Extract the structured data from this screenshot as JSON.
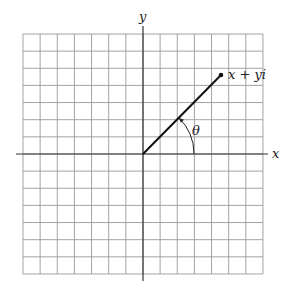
{
  "diagram": {
    "grid": {
      "columns": 14,
      "rows": 14,
      "left": 23,
      "top": 34,
      "cell_size": 17.14,
      "line_color": "#9a9a9a"
    },
    "axes": {
      "color": "#333333",
      "origin": {
        "x": 143,
        "y": 154
      },
      "x_axis": {
        "from": 16,
        "to": 268,
        "label": "x"
      },
      "y_axis": {
        "from": 26,
        "to": 281,
        "label": "y"
      }
    },
    "vector": {
      "color": "#111111",
      "from": {
        "x": 143,
        "y": 154
      },
      "to": {
        "x": 221,
        "y": 75
      },
      "point_label": "x + yi"
    },
    "angle": {
      "label": "θ",
      "radius": 51,
      "color": "#222222"
    }
  }
}
